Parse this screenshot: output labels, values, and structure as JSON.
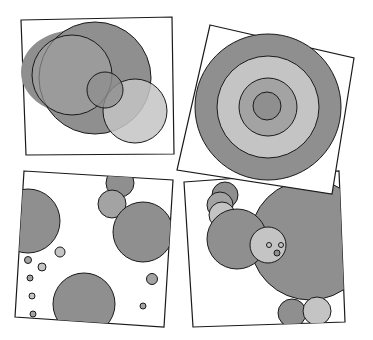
{
  "colors": {
    "dark": "#8f8f8f",
    "mid": "#a3a3a3",
    "light": "#c4c4c4",
    "stroke": "#1a1a1a",
    "paper": "#ffffff"
  },
  "panels": [
    {
      "name": "overlapping-circles",
      "position": "top-left"
    },
    {
      "name": "concentric-circles",
      "position": "top-right"
    },
    {
      "name": "scattered-circles",
      "position": "bottom-left"
    },
    {
      "name": "face-circles",
      "position": "bottom-right"
    }
  ]
}
